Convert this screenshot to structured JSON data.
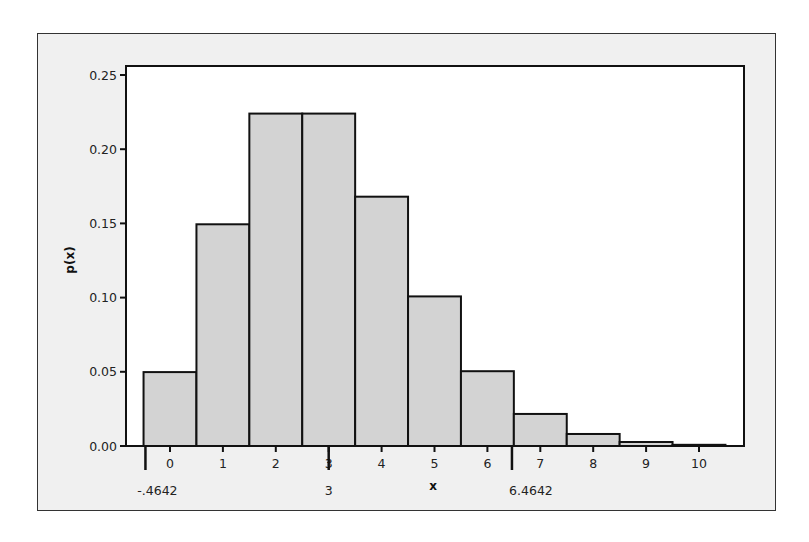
{
  "chart_data": {
    "type": "bar",
    "title": "",
    "xlabel": "x",
    "ylabel": "p(x)",
    "categories": [
      "0",
      "1",
      "2",
      "3",
      "4",
      "5",
      "6",
      "7",
      "8",
      "9",
      "10"
    ],
    "values": [
      0.0498,
      0.1494,
      0.224,
      0.224,
      0.168,
      0.1008,
      0.0504,
      0.0216,
      0.0081,
      0.0027,
      0.0008
    ],
    "ylim": [
      0,
      0.25
    ],
    "yticks": [
      "0.00",
      "0.05",
      "0.10",
      "0.15",
      "0.20",
      "0.25"
    ],
    "xticks": [
      "0",
      "1",
      "2",
      "3",
      "4",
      "5",
      "6",
      "7",
      "8",
      "9",
      "10"
    ],
    "grid": false,
    "legend": null,
    "bar_color": "#d3d3d3",
    "annotations": [
      {
        "x": -0.4642,
        "label": "-.4642"
      },
      {
        "x": 3,
        "label": "3"
      },
      {
        "x": 6.4642,
        "label": "6.4642"
      }
    ]
  }
}
